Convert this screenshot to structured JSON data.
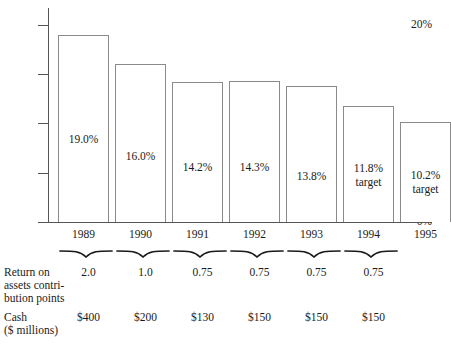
{
  "chart_data": {
    "type": "bar",
    "title": "",
    "xlabel": "",
    "ylabel": "",
    "ylim": [
      0,
      20
    ],
    "grid": false,
    "legend": "none",
    "axis_tick_labels": [
      "0%",
      "20%"
    ],
    "axis_ticks": [
      0,
      5,
      10,
      15,
      20
    ],
    "categories": [
      "1989",
      "1990",
      "1991",
      "1992",
      "1993",
      "1994",
      "1995"
    ],
    "values": [
      19.0,
      16.0,
      14.2,
      14.3,
      13.8,
      11.8,
      10.2
    ],
    "bar_labels": [
      {
        "value": "19.0%",
        "note": ""
      },
      {
        "value": "16.0%",
        "note": ""
      },
      {
        "value": "14.2%",
        "note": ""
      },
      {
        "value": "14.3%",
        "note": ""
      },
      {
        "value": "13.8%",
        "note": ""
      },
      {
        "value": "11.8%",
        "note": "target"
      },
      {
        "value": "10.2%",
        "note": "target"
      }
    ],
    "annotations": {
      "roa_caption": "Return on assets contribution points",
      "roa_values": [
        "2.0",
        "1.0",
        "0.75",
        "0.75",
        "0.75",
        "0.75"
      ],
      "cash_caption": "Cash ($ millions)",
      "cash_values": [
        "$400",
        "$200",
        "$130",
        "$150",
        "$150",
        "$150"
      ]
    }
  },
  "axis": {
    "tick_top_label": "20%",
    "tick_bottom_label": "0%"
  },
  "bars": [
    {
      "year": "1989",
      "value_label": "19.0%",
      "note_label": ""
    },
    {
      "year": "1990",
      "value_label": "16.0%",
      "note_label": ""
    },
    {
      "year": "1991",
      "value_label": "14.2%",
      "note_label": ""
    },
    {
      "year": "1992",
      "value_label": "14.3%",
      "note_label": ""
    },
    {
      "year": "1993",
      "value_label": "13.8%",
      "note_label": ""
    },
    {
      "year": "1994",
      "value_label": "11.8%",
      "note_label": "target"
    },
    {
      "year": "1995",
      "value_label": "10.2%",
      "note_label": "target"
    }
  ],
  "roa_row": {
    "caption_line1": "Return on",
    "caption_line2": "assets contri-",
    "caption_line3": "bution points",
    "values": [
      "2.0",
      "1.0",
      "0.75",
      "0.75",
      "0.75",
      "0.75"
    ]
  },
  "cash_row": {
    "caption_line1": "Cash",
    "caption_line2": "($ millions)",
    "values": [
      "$400",
      "$200",
      "$130",
      "$150",
      "$150",
      "$150"
    ]
  },
  "colors": {
    "bar_stroke": "#8a8a8a",
    "axis": "#555555",
    "text": "#1a1a1a",
    "background": "#ffffff"
  }
}
